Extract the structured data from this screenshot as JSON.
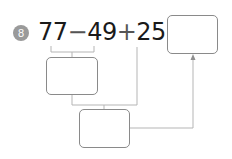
{
  "problem": {
    "number": "8",
    "expression": {
      "terms": [
        "77",
        "−",
        "49",
        "+",
        "25",
        "="
      ]
    },
    "boxes": {
      "step1": "",
      "step2": "",
      "result": ""
    }
  },
  "colors": {
    "badge": "#9a9a9a",
    "text": "#1a1a1a",
    "lines": "#b5b5b5",
    "box_border": "#8a8a8a"
  }
}
